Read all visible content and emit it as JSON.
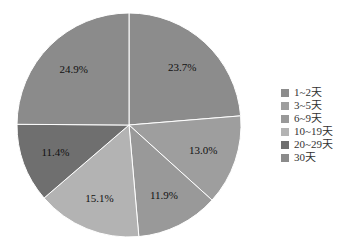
{
  "chart_data": {
    "type": "pie",
    "title": "",
    "start_angle_deg": 0,
    "direction": "clockwise",
    "categories": [
      "1~2天",
      "3~5天",
      "6~9天",
      "10~19天",
      "20~29天",
      "30天"
    ],
    "values": [
      23.7,
      13.0,
      11.9,
      15.1,
      11.4,
      24.9
    ],
    "value_labels": [
      "23.7%",
      "13.0%",
      "11.9%",
      "15.1%",
      "11.4%",
      "24.9%"
    ],
    "colors": [
      "#8c8c8c",
      "#9e9e9e",
      "#999999",
      "#b3b3b3",
      "#6f6f6f",
      "#8b8b8b"
    ],
    "legend_position": "right",
    "label_unit": "%"
  },
  "legend": {
    "items": [
      {
        "label": "1~2天",
        "color": "#8c8c8c"
      },
      {
        "label": "3~5天",
        "color": "#9e9e9e"
      },
      {
        "label": "6~9天",
        "color": "#999999"
      },
      {
        "label": "10~19天",
        "color": "#b3b3b3"
      },
      {
        "label": "20~29天",
        "color": "#6f6f6f"
      },
      {
        "label": "30天",
        "color": "#8b8b8b"
      }
    ]
  }
}
